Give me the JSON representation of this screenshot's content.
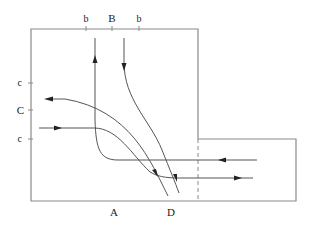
{
  "diagram": {
    "type": "intersection-traffic-flow",
    "colors": {
      "outline": "#8a8a8a",
      "paths": "#555555",
      "arrows": "#222222",
      "text": "#222222"
    },
    "top_labels": [
      {
        "text": "b",
        "x": 86
      },
      {
        "text": "B",
        "x": 112
      },
      {
        "text": "b",
        "x": 139
      }
    ],
    "left_labels": [
      {
        "text": "c",
        "y": 83
      },
      {
        "text": "C",
        "y": 110
      },
      {
        "text": "c",
        "y": 139
      }
    ],
    "bottom_labels": [
      {
        "text": "A",
        "x": 114
      },
      {
        "text": "D",
        "x": 171
      }
    ],
    "flows": [
      {
        "name": "from-right-turning-up",
        "direction": "right-to-top"
      },
      {
        "name": "from-top-turning-down",
        "direction": "top-to-bottom-right"
      },
      {
        "name": "to-left-curve",
        "direction": "bottom-right-to-left"
      },
      {
        "name": "from-left-turning-right",
        "direction": "left-to-right"
      }
    ]
  }
}
